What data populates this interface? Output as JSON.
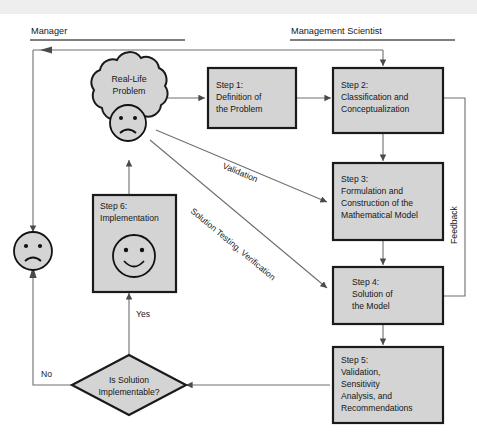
{
  "diagram": {
    "headers": {
      "left": "Manager",
      "right": "Management Scientist"
    },
    "cloud": {
      "name": "real-life-problem",
      "line1": "Real-Life",
      "line2": "Problem",
      "face": "sad-face-icon"
    },
    "manager_face": {
      "name": "manager-sad-face",
      "face": "sad-face-icon"
    },
    "steps": [
      {
        "id": "step1",
        "lines": [
          "Step 1:",
          "Definition of",
          "the Problem"
        ]
      },
      {
        "id": "step2",
        "lines": [
          "Step 2:",
          "Classification and",
          "Conceptualization"
        ]
      },
      {
        "id": "step3",
        "lines": [
          "Step 3:",
          "Formulation and",
          "Construction of the",
          "Mathematical Model"
        ]
      },
      {
        "id": "step4",
        "lines": [
          "Step 4:",
          "Solution of",
          "the Model"
        ]
      },
      {
        "id": "step5",
        "lines": [
          "Step 5:",
          "Validation,",
          "Sensitivity",
          "Analysis, and",
          "Recommendations"
        ]
      },
      {
        "id": "step6",
        "lines": [
          "Step 6:",
          "Implementation"
        ],
        "face": "happy-face-icon"
      }
    ],
    "decision": {
      "id": "is-solution-implementable",
      "line1": "Is Solution",
      "line2": "Implementable?"
    },
    "edge_labels": {
      "validation": "Validation",
      "solution_testing": "Solution Testing, Verification",
      "feedback": "Feedback",
      "yes": "Yes",
      "no": "No"
    },
    "colors": {
      "box_fill": "#d4d4d4",
      "box_stroke": "#1a1a1a",
      "line": "#6e6e6e",
      "text": "#171717",
      "band": "#eeeeee"
    }
  }
}
